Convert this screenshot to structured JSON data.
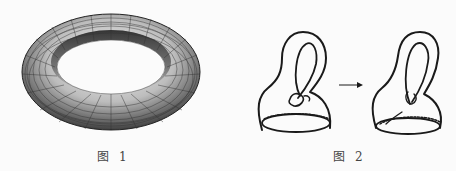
{
  "figures": [
    {
      "id": "figure-1",
      "subject": "torus",
      "caption_prefix": "图",
      "caption_number": "1"
    },
    {
      "id": "figure-2",
      "subject": "klein-bottle-transformation",
      "caption_prefix": "图",
      "caption_number": "2",
      "parts": [
        "klein-bottle-before",
        "arrow",
        "klein-bottle-after"
      ]
    }
  ],
  "colors": {
    "background": "#fbfbfb",
    "ink": "#1a1a1a",
    "torus_light": "#e8e8e8",
    "torus_dark": "#2a2a2a"
  }
}
